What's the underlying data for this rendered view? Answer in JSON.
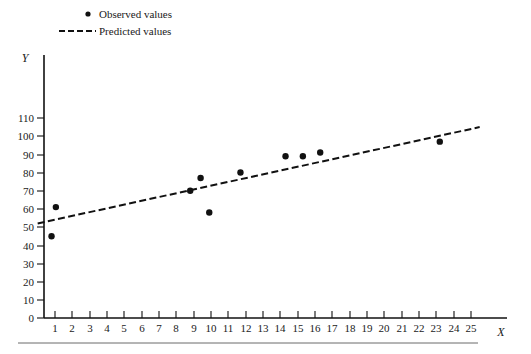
{
  "figure": {
    "background_color": "#ffffff",
    "ink_color": "#111111",
    "width": 531,
    "height": 354
  },
  "legend": {
    "position": "top-left",
    "entries": [
      {
        "label": "Observed values",
        "marker": "dot-marker",
        "color": "#111111"
      },
      {
        "label": "Predicted values",
        "marker": "dashed-line-marker",
        "color": "#111111"
      }
    ]
  },
  "axes": {
    "x_title": "X",
    "y_title": "Y",
    "x_ticks": [
      "1",
      "2",
      "3",
      "4",
      "5",
      "6",
      "7",
      "8",
      "9",
      "10",
      "11",
      "12",
      "13",
      "14",
      "15",
      "16",
      "17",
      "18",
      "19",
      "20",
      "21",
      "22",
      "23",
      "24",
      "25"
    ],
    "y_ticks": [
      "0",
      "10",
      "20",
      "30",
      "40",
      "50",
      "60",
      "70",
      "80",
      "90",
      "100",
      "110"
    ]
  },
  "chart_data": {
    "type": "scatter",
    "title": "",
    "xlabel": "X",
    "ylabel": "Y",
    "xlim": [
      0,
      25.8
    ],
    "ylim": [
      0,
      118
    ],
    "grid": false,
    "legend_position": "top-left",
    "series": [
      {
        "name": "Observed values",
        "type": "scatter",
        "marker": "circle",
        "color": "#111111",
        "points": [
          {
            "x": 0.8,
            "y": 45
          },
          {
            "x": 1.05,
            "y": 61
          },
          {
            "x": 8.8,
            "y": 70
          },
          {
            "x": 9.4,
            "y": 77
          },
          {
            "x": 9.9,
            "y": 58
          },
          {
            "x": 11.7,
            "y": 80
          },
          {
            "x": 14.3,
            "y": 89
          },
          {
            "x": 15.3,
            "y": 89
          },
          {
            "x": 16.3,
            "y": 91
          },
          {
            "x": 23.2,
            "y": 97
          }
        ]
      },
      {
        "name": "Predicted values",
        "type": "line",
        "style": "dashed",
        "color": "#111111",
        "endpoints": [
          {
            "x": 0.0,
            "y": 52
          },
          {
            "x": 25.5,
            "y": 105
          }
        ]
      }
    ]
  }
}
